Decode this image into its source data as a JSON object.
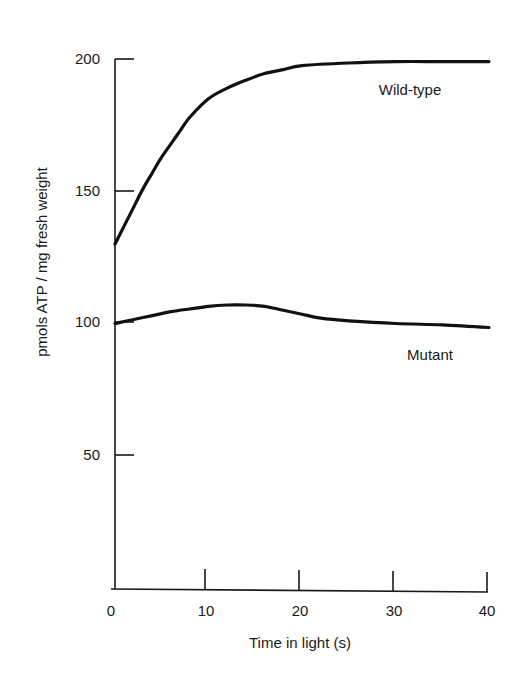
{
  "chart_data": {
    "type": "line",
    "title": "",
    "xlabel": "Time in light (s)",
    "ylabel": "pmols ATP / mg fresh weight",
    "xlim": [
      0,
      40
    ],
    "ylim": [
      0,
      200
    ],
    "x_ticks": [
      0,
      10,
      20,
      30,
      40
    ],
    "y_ticks": [
      50,
      100,
      150,
      200
    ],
    "grid": false,
    "legend": "inline labels next to curves",
    "series": [
      {
        "name": "Wild-type",
        "x": [
          0,
          1,
          2,
          3,
          4,
          5,
          6,
          7,
          8,
          10,
          12,
          14,
          16,
          18,
          20,
          25,
          30,
          35,
          40
        ],
        "values": [
          130,
          137,
          144,
          151,
          157,
          163,
          168,
          173,
          178,
          185,
          189,
          192,
          194.5,
          196,
          197.5,
          198.5,
          199,
          199,
          199
        ]
      },
      {
        "name": "Mutant",
        "x": [
          0,
          2,
          4,
          6,
          8,
          10,
          12,
          14,
          16,
          18,
          20,
          22,
          25,
          30,
          35,
          40
        ],
        "values": [
          100,
          101.5,
          103,
          104.5,
          105.5,
          106.5,
          107,
          107,
          106.5,
          105,
          103.5,
          102,
          101,
          100,
          99.5,
          98.5
        ]
      }
    ]
  },
  "labels": {
    "x_tick_labels": [
      "0",
      "10",
      "20",
      "30",
      "40"
    ],
    "y_tick_labels": [
      "50",
      "100",
      "150",
      "200"
    ],
    "x_axis_title": "Time in light (s)",
    "y_axis_title": "pmols ATP / mg fresh weight",
    "series_wild_type": "Wild-type",
    "series_mutant": "Mutant"
  },
  "colors": {
    "line": "#111111",
    "axis": "#1a1a1a",
    "background": "#ffffff"
  }
}
